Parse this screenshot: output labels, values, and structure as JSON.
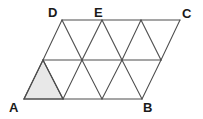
{
  "figure": {
    "type": "geometry-diagram",
    "background_color": "#ffffff",
    "stroke_color": "#4d4d4d",
    "shaded_fill_color": "#e8e8e8",
    "stroke_width": 1,
    "labels": [
      {
        "id": "A",
        "text": "A",
        "x": 9,
        "y": 101,
        "vertex_x": 24,
        "vertex_y": 99
      },
      {
        "id": "B",
        "text": "B",
        "x": 143,
        "y": 101,
        "vertex_x": 142,
        "vertex_y": 99
      },
      {
        "id": "C",
        "text": "C",
        "x": 182,
        "y": 7,
        "vertex_x": 180,
        "vertex_y": 20
      },
      {
        "id": "D",
        "text": "D",
        "x": 48,
        "y": 6,
        "vertex_x": 62,
        "vertex_y": 20
      },
      {
        "id": "E",
        "text": "E",
        "x": 94,
        "y": 6,
        "vertex_x": 102,
        "vertex_y": 20
      }
    ],
    "grid": {
      "rows": 2,
      "columns": 3,
      "triangles_total": 12,
      "row_height": 39,
      "cell_width": 39,
      "shear_offset": 19,
      "top_row_y": 20,
      "middle_row_y": 60,
      "bottom_row_y": 99,
      "top_row_x": [
        62,
        102,
        141,
        180
      ],
      "middle_row_x": [
        43,
        82,
        122,
        161
      ],
      "bottom_row_x": [
        24,
        63,
        102,
        142
      ]
    },
    "horizontal_lines": [
      {
        "name": "line-DC-top",
        "x1": 62,
        "y1": 20,
        "x2": 180,
        "y2": 20
      },
      {
        "name": "line-middle",
        "x1": 43,
        "y1": 60,
        "x2": 161,
        "y2": 60
      },
      {
        "name": "line-AB-bottom",
        "x1": 24,
        "y1": 99,
        "x2": 142,
        "y2": 99
      }
    ],
    "left_edges": [
      {
        "name": "edge-up-1",
        "x1": 24,
        "y1": 99,
        "x2": 43,
        "y2": 60
      },
      {
        "name": "edge-up-2",
        "x1": 43,
        "y1": 60,
        "x2": 62,
        "y2": 20
      }
    ],
    "right_edges": [
      {
        "name": "edge-down-1",
        "x1": 180,
        "y1": 20,
        "x2": 161,
        "y2": 60
      },
      {
        "name": "edge-down-2",
        "x1": 161,
        "y1": 60,
        "x2": 142,
        "y2": 99
      }
    ],
    "shaded_triangle": {
      "name": "shaded-triangle-A",
      "points": "24,99 63,99 43,60"
    }
  }
}
